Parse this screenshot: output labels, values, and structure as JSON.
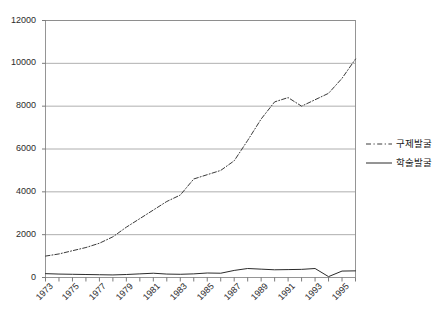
{
  "chart_data": {
    "type": "line",
    "title": "",
    "subtitle": "",
    "xlabel": "",
    "ylabel": "",
    "xlim": [
      1973,
      1996
    ],
    "ylim": [
      0,
      12000
    ],
    "ytick_labels": [
      "0",
      "2000",
      "4000",
      "6000",
      "8000",
      "10000",
      "12000"
    ],
    "ytick_values": [
      0,
      2000,
      4000,
      6000,
      8000,
      10000,
      12000
    ],
    "xtick_labels": [
      "1973",
      "1975",
      "1977",
      "1979",
      "1981",
      "1983",
      "1985",
      "1987",
      "1989",
      "1991",
      "1993",
      "1995"
    ],
    "xtick_values": [
      1973,
      1975,
      1977,
      1979,
      1981,
      1983,
      1985,
      1987,
      1989,
      1991,
      1993,
      1995
    ],
    "x": [
      1973,
      1974,
      1975,
      1976,
      1977,
      1978,
      1979,
      1980,
      1981,
      1982,
      1983,
      1984,
      1985,
      1986,
      1987,
      1988,
      1989,
      1990,
      1991,
      1992,
      1993,
      1994,
      1995,
      1996
    ],
    "grid": "horizontal",
    "legend_position": "right",
    "series": [
      {
        "name": "구제발굴",
        "style": "dash-dot",
        "color": "#3a3a3a",
        "values": [
          1000,
          1100,
          1250,
          1400,
          1600,
          1900,
          2350,
          2750,
          3150,
          3550,
          3850,
          4600,
          4800,
          5000,
          5450,
          6400,
          7400,
          8200,
          8400,
          8000,
          8300,
          8600,
          9300,
          10200
        ]
      },
      {
        "name": "학술발굴",
        "style": "solid",
        "color": "#2b2b2b",
        "values": [
          180,
          160,
          150,
          140,
          130,
          120,
          140,
          170,
          200,
          160,
          150,
          170,
          210,
          200,
          330,
          420,
          390,
          360,
          370,
          380,
          420,
          40,
          300,
          310
        ]
      }
    ]
  },
  "legend": {
    "items": [
      {
        "label": "구제발굴",
        "style": "dash-dot"
      },
      {
        "label": "학술발굴",
        "style": "solid"
      }
    ]
  },
  "colors": {
    "axis": "#6d6d6d",
    "grid": "#9a9a9a",
    "plot_border": "#8a8a8a",
    "text": "#2b2b2b",
    "background": "#ffffff"
  }
}
